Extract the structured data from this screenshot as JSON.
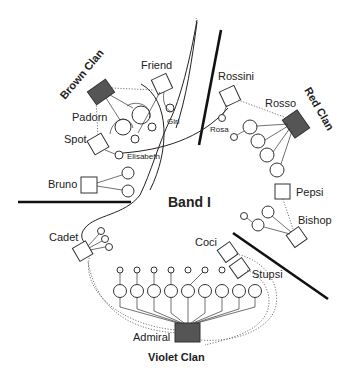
{
  "title": "Band I",
  "clans": {
    "brown": "Brown Clan",
    "red": "Red Clan",
    "violet": "Violet Clan"
  },
  "individuals": {
    "friend": "Friend",
    "padorn": "Padorn",
    "spot": "Spot",
    "girl": "Girl",
    "elisabeth": "Elisabeth",
    "rossini": "Rossini",
    "rosso": "Rosso",
    "rosa": "Rosa",
    "bruno": "Bruno",
    "pepsi": "Pepsi",
    "bishop": "Bishop",
    "cadet": "Cadet",
    "coci": "Coci",
    "stupsi": "Stupsi",
    "admiral": "Admiral"
  },
  "legend_symbols": {
    "clan_leader": "filled-rectangle",
    "male": "open-square",
    "female": "large-circle",
    "offspring": "small-circle"
  },
  "colors": {
    "leader_fill": "#555555",
    "stroke": "#333333",
    "background": "#ffffff"
  }
}
